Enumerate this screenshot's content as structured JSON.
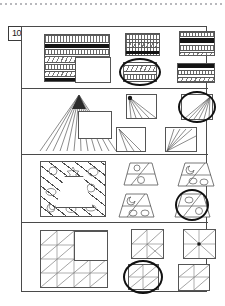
{
  "document": {
    "type": "worksheet-page",
    "question_number": "10",
    "panel_count": 4,
    "background_color": "#ffffff",
    "ink_color": "#333333",
    "marker_color": "#111111"
  },
  "scan_artifact": {
    "name": "dotted-scan-line",
    "color": "#b9b9bd"
  },
  "panels": [
    {
      "id": "panel-1",
      "pattern_type": "horizontal-stripe-bands",
      "prompt": {
        "name": "stimulus-striped-square",
        "bands": [
          "tick",
          "solid",
          "tick",
          "wave",
          "plain",
          "solid"
        ],
        "occluder": "white-square"
      },
      "options": [
        {
          "label": "A",
          "bands": [
            "tick",
            "wave",
            "solid"
          ],
          "selected": "false",
          "circled": "false"
        },
        {
          "label": "B",
          "bands": [
            "tick",
            "solid",
            "tick"
          ],
          "selected": "false",
          "circled": "false"
        },
        {
          "label": "C",
          "bands": [
            "wave",
            "tick"
          ],
          "selected": "true",
          "circled": "true"
        },
        {
          "label": "D",
          "bands": [
            "solid",
            "tick",
            "wave"
          ],
          "selected": "false",
          "circled": "false"
        }
      ]
    },
    {
      "id": "panel-2",
      "pattern_type": "radiating-fan-rays",
      "prompt": {
        "name": "stimulus-fan-square",
        "apex": "top-center",
        "ray_count": 14,
        "occluder": "white-square"
      },
      "options": [
        {
          "label": "A",
          "apex": "top-left",
          "ray_count": 6,
          "selected": "false",
          "circled": "false"
        },
        {
          "label": "B",
          "apex": "top-right",
          "ray_count": 8,
          "selected": "true",
          "circled": "true"
        },
        {
          "label": "C",
          "apex": "top-left",
          "ray_count": 4,
          "selected": "false",
          "circled": "false"
        },
        {
          "label": "D",
          "apex": "bottom-left",
          "ray_count": 7,
          "selected": "false",
          "circled": "false"
        }
      ]
    },
    {
      "id": "panel-3",
      "pattern_type": "diagonal-bands-with-symbols",
      "prompt": {
        "name": "stimulus-diagonal-square",
        "symbols": [
          "circle",
          "star",
          "crescent",
          "oval",
          "leaf"
        ],
        "occluder": "white-trapezoid"
      },
      "options": [
        {
          "label": "A",
          "shape": "trapezoid",
          "selected": "false",
          "circled": "false"
        },
        {
          "label": "B",
          "shape": "trapezoid",
          "selected": "false",
          "circled": "false"
        },
        {
          "label": "C",
          "shape": "trapezoid",
          "selected": "false",
          "circled": "false"
        },
        {
          "label": "D",
          "shape": "trapezoid",
          "selected": "true",
          "circled": "true"
        }
      ]
    },
    {
      "id": "panel-4",
      "pattern_type": "grid-with-diagonals",
      "prompt": {
        "name": "stimulus-grid-square",
        "rows": 4,
        "cols": 4,
        "occluder": "white-square"
      },
      "options": [
        {
          "label": "A",
          "rows": 2,
          "cols": 2,
          "selected": "false",
          "circled": "false"
        },
        {
          "label": "B",
          "rows": 2,
          "cols": 2,
          "selected": "false",
          "circled": "false"
        },
        {
          "label": "C",
          "rows": 2,
          "cols": 2,
          "selected": "true",
          "circled": "true"
        },
        {
          "label": "D",
          "rows": 2,
          "cols": 2,
          "selected": "false",
          "circled": "false"
        }
      ]
    }
  ]
}
